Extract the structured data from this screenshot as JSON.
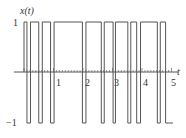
{
  "chart_data": {
    "type": "line",
    "title": "",
    "ylabel": "x(t)",
    "xlabel": "t",
    "xlim": [
      0,
      5.2
    ],
    "ylim": [
      -1,
      1
    ],
    "x_ticks": [
      "1",
      "2",
      "3",
      "4",
      "5"
    ],
    "y_ticks": [
      "1",
      "-1"
    ],
    "y_tick_labels": {
      "top": "1",
      "bottom": "−1"
    },
    "series": [
      {
        "name": "x(t)",
        "style": "square-wave",
        "transitions_t": [
          0.0,
          0.1,
          0.22,
          0.5,
          0.62,
          0.9,
          1.02,
          1.98,
          2.1,
          2.62,
          2.72,
          3.02,
          3.1,
          3.52,
          3.62,
          3.82,
          3.95,
          4.52,
          4.62,
          4.8
        ],
        "start_level": 1
      }
    ],
    "grid": false,
    "legend": null
  },
  "labels": {
    "y_axis": "x(t)",
    "x_axis": "t",
    "y_top": "1",
    "y_bottom": "−1",
    "tick_1": "1",
    "tick_2": "2",
    "tick_3": "3",
    "tick_4": "4",
    "tick_5": "5"
  },
  "colors": {
    "wave": "#555555",
    "axis": "#444444",
    "minor": "#666666"
  }
}
